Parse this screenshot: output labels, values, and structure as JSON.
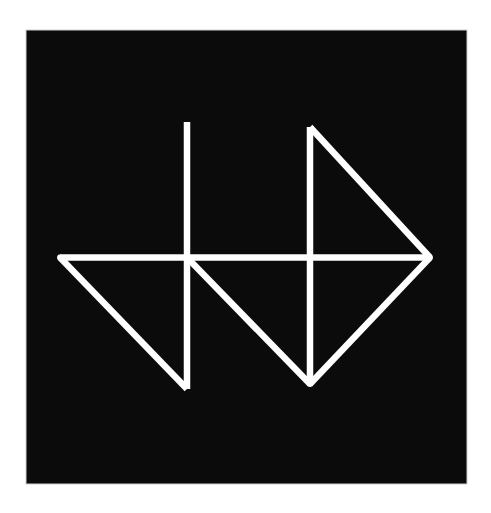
{
  "artwork": {
    "title": "Geometric line emblem",
    "colors": {
      "page_background": "#ffffff",
      "panel": "#0b0b0b",
      "panel_border": "#cfcfcf",
      "stroke": "#ffffff"
    },
    "panel": {
      "x": 26,
      "y": 30,
      "width": 441,
      "height": 454
    },
    "stroke_width": 6.5,
    "segments": [
      {
        "name": "horizontal-bar",
        "points": [
          [
            60,
            257.5
          ],
          [
            430,
            257.5
          ]
        ]
      },
      {
        "name": "left-vertical",
        "points": [
          [
            187,
            122
          ],
          [
            187,
            389
          ]
        ]
      },
      {
        "name": "left-diagonal",
        "points": [
          [
            60,
            257.5
          ],
          [
            187,
            389
          ]
        ]
      },
      {
        "name": "middle-diagonal",
        "points": [
          [
            187,
            257.5
          ],
          [
            310,
            384
          ]
        ]
      },
      {
        "name": "right-vertical",
        "points": [
          [
            310,
            127
          ],
          [
            310,
            384
          ]
        ]
      },
      {
        "name": "right-upper-diagonal",
        "points": [
          [
            310,
            127
          ],
          [
            430,
            257.5
          ]
        ]
      },
      {
        "name": "right-lower-diagonal",
        "points": [
          [
            430,
            257.5
          ],
          [
            310,
            384
          ]
        ]
      }
    ]
  }
}
